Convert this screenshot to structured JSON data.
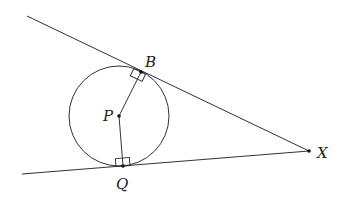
{
  "diagram": {
    "labels": {
      "B": "B",
      "P": "P",
      "Q": "Q",
      "X": "X"
    },
    "points": {
      "P": [
        119,
        115
      ],
      "B": [
        141,
        73
      ],
      "Q": [
        123,
        166
      ],
      "X": [
        309,
        151
      ]
    },
    "circle": {
      "center": "P",
      "radius": 50
    },
    "lines": [
      {
        "from": [
          27,
          16
        ],
        "to": [
          309,
          151
        ],
        "name": "tangent-XB"
      },
      {
        "from": [
          22,
          174
        ],
        "to": [
          309,
          151
        ],
        "name": "tangent-XQ"
      }
    ],
    "segments": [
      {
        "from": "P",
        "to": "B"
      },
      {
        "from": "P",
        "to": "Q"
      }
    ],
    "right_angles": [
      "B",
      "Q"
    ],
    "colors": {
      "stroke": "#333333",
      "background": "#ffffff"
    }
  }
}
